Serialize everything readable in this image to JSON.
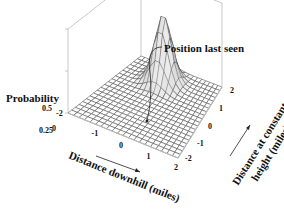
{
  "chart_data": {
    "type": "surface3d",
    "title": "",
    "zlabel": "Probability",
    "xlabel": "Distance downhill (miles)",
    "ylabel_line1": "Distance at constant",
    "ylabel_line2": "height (miles)",
    "annotation": "Position last seen",
    "z_ticks": [
      "0",
      "0.25",
      "0.5"
    ],
    "x_ticks": [
      "-2",
      "-1",
      "0",
      "1",
      "2"
    ],
    "y_ticks": [
      "-2",
      "-1",
      "0",
      "1",
      "2"
    ],
    "zlim": [
      0,
      0.5
    ],
    "xlim": [
      -2,
      2
    ],
    "ylim": [
      -2,
      2
    ],
    "grid_divisions": 20,
    "peak": {
      "x": -0.3,
      "y": 1.2,
      "z": 0.4,
      "sigma_x": 0.35,
      "sigma_y": 0.3
    },
    "colors": {
      "grid": "#555555",
      "box": "#bbbbbb",
      "surface_dark": "#222222",
      "surface_light": "#f2f2f2"
    }
  }
}
